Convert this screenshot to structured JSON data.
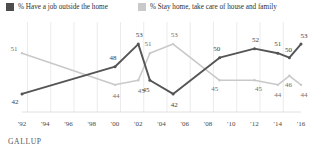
{
  "legend": {
    "items": [
      {
        "label": "% Have a job outside the home",
        "color": "#4d4d4d",
        "icon": "square-swatch-dark"
      },
      {
        "label": "% Stay home, take care of house and family",
        "color": "#c9c9c9",
        "icon": "square-swatch-light"
      }
    ]
  },
  "source": "GALLUP",
  "chart_data": {
    "type": "line",
    "title": "",
    "subtitle": "",
    "xlabel": "",
    "ylabel": "",
    "grid": true,
    "legend_position": "top",
    "ylim": [
      38,
      57
    ],
    "xlim": [
      1992,
      2016
    ],
    "x": [
      1992,
      1994,
      1996,
      1998,
      2000,
      2001,
      2002,
      2003,
      2005,
      2007,
      2009,
      2012,
      2014,
      2015,
      2016
    ],
    "tick_labels": [
      "'92",
      "'94",
      "'96",
      "'98",
      "'00",
      "'02",
      "'04",
      "'06",
      "'08",
      "'10",
      "'12",
      "'14",
      "'16"
    ],
    "series": [
      {
        "name": "% Have a job outside the home",
        "color": "#4d4d4d",
        "values": [
          42,
          null,
          null,
          null,
          48,
          null,
          53,
          45,
          42,
          null,
          50,
          52,
          51,
          50,
          53
        ],
        "labels": [
          "42",
          "",
          "",
          "",
          "48",
          "",
          "53",
          "45",
          "42",
          "",
          "50",
          "52",
          "51",
          "50",
          "53"
        ]
      },
      {
        "name": "% Stay home, take care of house and family",
        "color": "#c9c9c9",
        "values": [
          51,
          null,
          null,
          null,
          44,
          null,
          45,
          51,
          53,
          null,
          45,
          45,
          44,
          46,
          44
        ],
        "labels": [
          "51",
          "",
          "",
          "",
          "44",
          "",
          "45",
          "51",
          "53",
          "",
          "45",
          "45",
          "44",
          "46",
          "44"
        ]
      }
    ],
    "points": {
      "dark": [
        {
          "x": 1992,
          "y": 42,
          "label": "42"
        },
        {
          "x": 2000,
          "y": 48,
          "label": "48"
        },
        {
          "x": 2002,
          "y": 53,
          "label": "53"
        },
        {
          "x": 2003,
          "y": 45,
          "label": "45"
        },
        {
          "x": 2005,
          "y": 42,
          "label": "42"
        },
        {
          "x": 2009,
          "y": 50,
          "label": "50"
        },
        {
          "x": 2012,
          "y": 52,
          "label": "52"
        },
        {
          "x": 2014,
          "y": 51,
          "label": "51"
        },
        {
          "x": 2015,
          "y": 50,
          "label": "50"
        },
        {
          "x": 2016,
          "y": 53,
          "label": "53"
        }
      ],
      "light": [
        {
          "x": 1992,
          "y": 51,
          "label": "51"
        },
        {
          "x": 2000,
          "y": 44,
          "label": "44"
        },
        {
          "x": 2002,
          "y": 45,
          "label": "45"
        },
        {
          "x": 2003,
          "y": 51,
          "label": "51"
        },
        {
          "x": 2005,
          "y": 53,
          "label": "53"
        },
        {
          "x": 2009,
          "y": 45,
          "label": "45"
        },
        {
          "x": 2012,
          "y": 45,
          "label": "45"
        },
        {
          "x": 2014,
          "y": 44,
          "label": "44"
        },
        {
          "x": 2015,
          "y": 46,
          "label": "46"
        },
        {
          "x": 2016,
          "y": 44,
          "label": "44"
        }
      ]
    }
  }
}
